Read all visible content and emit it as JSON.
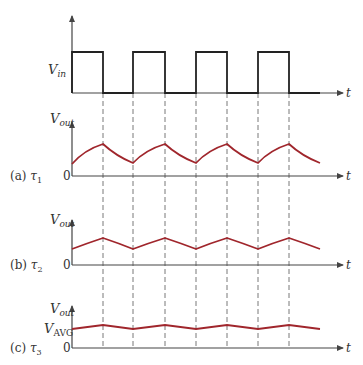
{
  "figure": {
    "input_panel": {
      "ylabel_main": "V",
      "ylabel_sub": "in",
      "xlabel": "t",
      "waveform": "square",
      "high_level_y": 52,
      "low_level_y": 93,
      "edges_x": [
        72,
        103,
        133,
        165,
        196,
        227,
        258,
        289,
        320
      ]
    },
    "panels": [
      {
        "id": "a",
        "caption_prefix": "(a) ",
        "tau_main": "τ",
        "tau_sub": "1",
        "ylabel_main": "V",
        "ylabel_sub": "out",
        "zero_label": "0",
        "xlabel": "t",
        "description": "Exponential charge/discharge, large ripple"
      },
      {
        "id": "b",
        "caption_prefix": "(b) ",
        "tau_main": "τ",
        "tau_sub": "2",
        "ylabel_main": "V",
        "ylabel_sub": "out",
        "zero_label": "0",
        "xlabel": "t",
        "description": "Near-linear ramp, medium ripple"
      },
      {
        "id": "c",
        "caption_prefix": "(c) ",
        "tau_main": "τ",
        "tau_sub": "3",
        "ylabel_main": "V",
        "ylabel_sub": "out",
        "avg_label_main": "V",
        "avg_label_sub": "AVG",
        "zero_label": "0",
        "xlabel": "t",
        "description": "Small ripple around V_AVG"
      }
    ],
    "colors": {
      "output_curve": "#a0262c",
      "square_wave": "#222222",
      "axes": "#444444",
      "dashed_guides": "#555555"
    }
  }
}
